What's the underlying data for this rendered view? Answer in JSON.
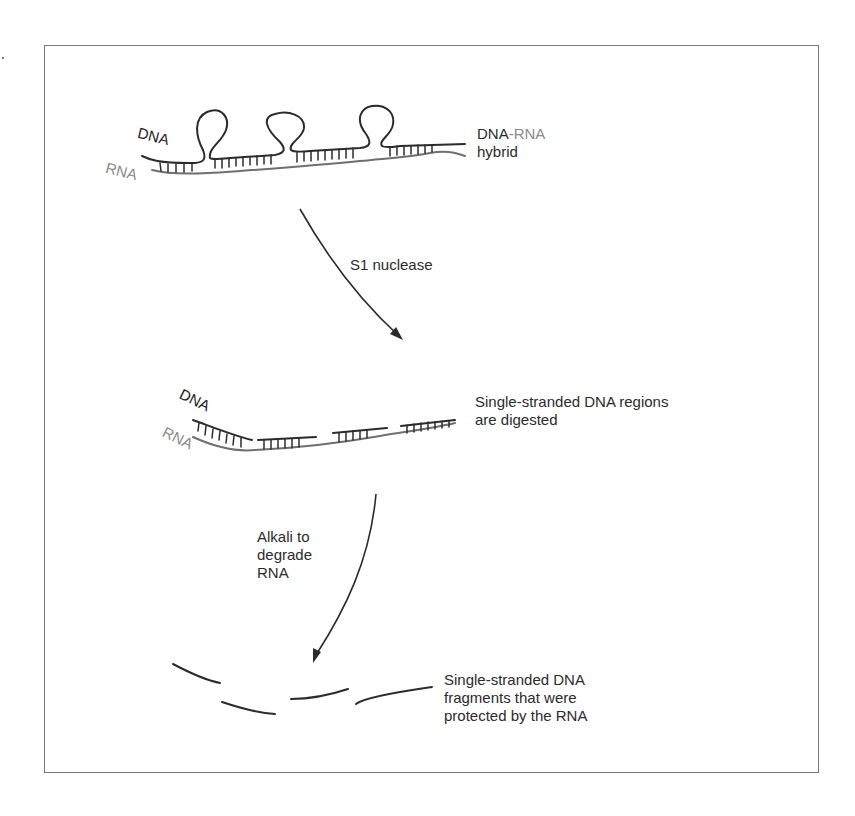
{
  "figure": {
    "colors": {
      "dna": "#2b2b2b",
      "rna": "#8a8a8a",
      "frame": "#777777",
      "text": "#2b2b2b"
    },
    "step1": {
      "strand_label_dna": "DNA",
      "strand_label_rna": "RNA",
      "caption_dna": "DNA",
      "caption_dash_rna": "-RNA",
      "caption_line2": "hybrid"
    },
    "arrow1": {
      "label": "S1 nuclease"
    },
    "step2": {
      "strand_label_dna": "DNA",
      "strand_label_rna": "RNA",
      "caption_line1": "Single-stranded DNA regions",
      "caption_line2": "are digested"
    },
    "arrow2": {
      "label_line1": "Alkali to",
      "label_line2": "degrade",
      "label_line3": "RNA"
    },
    "step3": {
      "caption_line1": "Single-stranded DNA",
      "caption_line2": "fragments that were",
      "caption_line3": "protected by the RNA",
      "fragment_count": 4
    }
  }
}
